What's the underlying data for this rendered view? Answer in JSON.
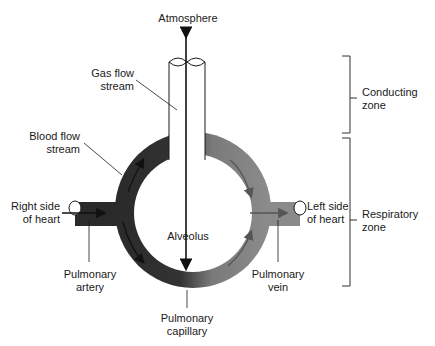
{
  "diagram": {
    "type": "physiology-schematic",
    "colors": {
      "deoxygenated_blood": "#2a2a2a",
      "oxygenated_blood": "#8a8a8a",
      "airway_fill": "#ffffff",
      "outline": "#1a1a1a"
    }
  },
  "labels": {
    "atmosphere": "Atmosphere",
    "gas_flow_1": "Gas flow",
    "gas_flow_2": "stream",
    "blood_flow_1": "Blood flow",
    "blood_flow_2": "stream",
    "right_heart_1": "Right side",
    "right_heart_2": "of heart",
    "left_heart_1": "Left side",
    "left_heart_2": "of heart",
    "alveolus": "Alveolus",
    "pulm_artery_1": "Pulmonary",
    "pulm_artery_2": "artery",
    "pulm_capillary_1": "Pulmonary",
    "pulm_capillary_2": "capillary",
    "pulm_vein_1": "Pulmonary",
    "pulm_vein_2": "vein",
    "conducting_1": "Conducting",
    "conducting_2": "zone",
    "respiratory_1": "Respiratory",
    "respiratory_2": "zone"
  }
}
